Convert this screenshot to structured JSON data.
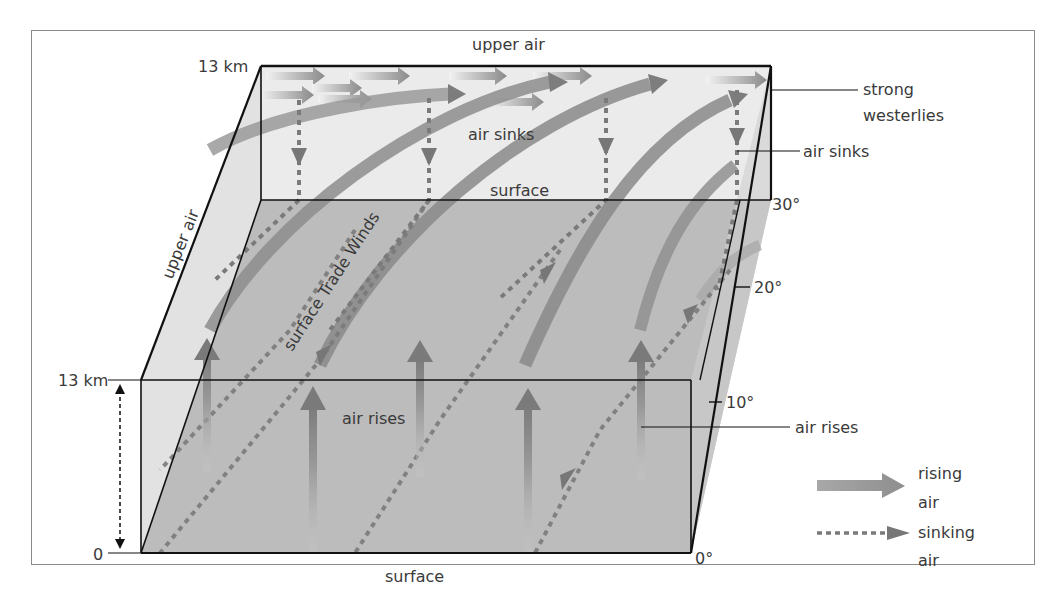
{
  "diagram": {
    "labels": {
      "upper_air_top": "upper air",
      "upper_air_side": "upper air",
      "height_top_back": "13 km",
      "height_top_front": "13 km",
      "height_zero": "0",
      "air_sinks_inside": "air sinks",
      "surface_back": "surface",
      "surface_front": "surface",
      "surface_trade_winds": "surface Trade Winds",
      "air_rises_inside": "air rises",
      "strong_westerlies_1": "strong",
      "strong_westerlies_2": "westerlies",
      "air_sinks_callout": "air sinks",
      "air_rises_callout": "air rises"
    },
    "latitude_ticks": [
      "30°",
      "20°",
      "10°",
      "0°"
    ],
    "legend": {
      "items": [
        {
          "symbol": "solid-arrow",
          "label_line1": "rising",
          "label_line2": "air"
        },
        {
          "symbol": "dotted-arrow",
          "label_line1": "sinking",
          "label_line2": "air"
        }
      ]
    },
    "colors": {
      "floor": "#b9b9b9",
      "back_wall": "#e9e9e9",
      "side_wall": "#dcdcdc",
      "arrow_dark": "#7c7c7c",
      "arrow_light": "#c8c8c8",
      "edge": "#111111",
      "text": "#3a3a3a"
    }
  }
}
